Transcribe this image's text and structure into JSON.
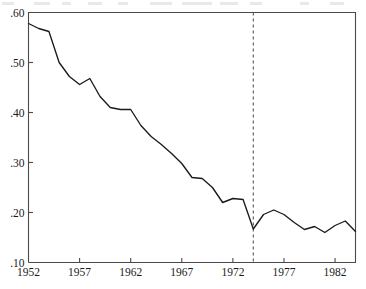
{
  "chart_data": {
    "type": "line",
    "title": "",
    "subtitle": "",
    "xlabel": "",
    "ylabel": "",
    "xlim": [
      1952,
      1984
    ],
    "ylim": [
      0.1,
      0.6
    ],
    "grid": false,
    "legend": null,
    "legend_position": "none",
    "x_ticks": [
      1952,
      1957,
      1962,
      1967,
      1972,
      1977,
      1982
    ],
    "x_tick_labels": [
      "1952",
      "1957",
      "1962",
      "1967",
      "1972",
      "1977",
      "1982"
    ],
    "y_ticks": [
      0.1,
      0.2,
      0.3,
      0.4,
      0.5,
      0.6
    ],
    "y_tick_labels": [
      ".10",
      ".20",
      ".30",
      ".40",
      ".50",
      ".60"
    ],
    "line_color": "#1a1a1a",
    "axis_color": "#4a4a4a",
    "annotations": [
      {
        "name": "structural-break-line",
        "type": "vertical-dashed-line",
        "x": 1974,
        "color": "#555555",
        "label": ""
      }
    ],
    "x": [
      1952,
      1953,
      1954,
      1955,
      1956,
      1957,
      1958,
      1959,
      1960,
      1961,
      1962,
      1963,
      1964,
      1965,
      1966,
      1967,
      1968,
      1969,
      1970,
      1971,
      1972,
      1973,
      1974,
      1975,
      1976,
      1977,
      1978,
      1979,
      1980,
      1981,
      1982,
      1983,
      1984
    ],
    "y": [
      0.578,
      0.568,
      0.562,
      0.5,
      0.472,
      0.456,
      0.468,
      0.432,
      0.41,
      0.406,
      0.406,
      0.374,
      0.352,
      0.336,
      0.318,
      0.298,
      0.27,
      0.268,
      0.25,
      0.22,
      0.228,
      0.226,
      0.167,
      0.196,
      0.205,
      0.196,
      0.18,
      0.166,
      0.172,
      0.16,
      0.174,
      0.183,
      0.162
    ],
    "series": [
      {
        "name": "series-1",
        "values": [
          0.578,
          0.568,
          0.562,
          0.5,
          0.472,
          0.456,
          0.468,
          0.432,
          0.41,
          0.406,
          0.406,
          0.374,
          0.352,
          0.336,
          0.318,
          0.298,
          0.27,
          0.268,
          0.25,
          0.22,
          0.228,
          0.226,
          0.167,
          0.196,
          0.205,
          0.196,
          0.18,
          0.166,
          0.172,
          0.16,
          0.174,
          0.183,
          0.162
        ]
      }
    ]
  }
}
